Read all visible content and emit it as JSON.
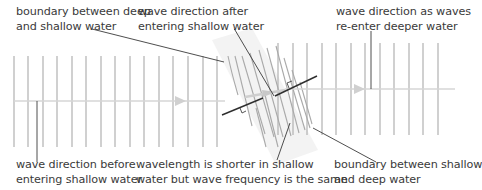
{
  "labels": {
    "boundary_deep_shallow": {
      "line1": "boundary between deep",
      "line2": "and shallow water"
    },
    "wave_after_shallow": {
      "line1": "wave direction after",
      "line2": "entering shallow water"
    },
    "wave_reenter_deep": {
      "line1": "wave direction as waves",
      "line2": "re-enter deeper water"
    },
    "wave_before_shallow": {
      "line1": "wave direction before",
      "line2": "entering shallow water"
    },
    "wavelength_note": {
      "line1": "wavelength is shorter in shallow",
      "line2": "water but wave frequency is the same"
    },
    "boundary_shallow_deep": {
      "line1": "boundary between shallow",
      "line2": "and deep water"
    }
  },
  "colors": {
    "wavefront": "#a9a9a9",
    "direction_arrow": "#d6d6d6",
    "boundary": "#2e2e2e",
    "leader": "#3a3a3a",
    "shallow_band": "#f2f2f2",
    "text": "#3a3a3a"
  },
  "geometry": {
    "deep_left_wavefronts_x": [
      14,
      28,
      43,
      57,
      72,
      86,
      101,
      115,
      130,
      144,
      159,
      173,
      188,
      203,
      217
    ],
    "deep_right_wavefronts_x": [
      278,
      293,
      307,
      322,
      336,
      351,
      365,
      380,
      394,
      409,
      423,
      438
    ],
    "wavefront_top_y": 56,
    "wavefront_bottom_y": 147,
    "direction_y": 101
  }
}
